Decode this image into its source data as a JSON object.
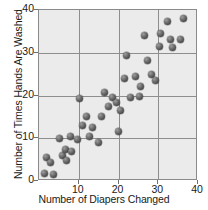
{
  "chart_data": {
    "type": "scatter",
    "title": "",
    "xlabel": "Number of Diapers Changed",
    "ylabel": "Number of Times Hands Are Washed",
    "xlim": [
      0,
      40
    ],
    "ylim": [
      0,
      40
    ],
    "xticks": [
      10,
      20,
      30,
      40
    ],
    "yticks": [
      0,
      10,
      20,
      30,
      40
    ],
    "xtick_labels": [
      "10",
      "20",
      "30",
      "40"
    ],
    "ytick_labels": [
      "0",
      "10",
      "20",
      "30",
      "40"
    ],
    "grid": true,
    "grid_color": "#8e8e8e",
    "plot_background": "#ebebeb",
    "marker_color": "#5a5a5a",
    "legend": null,
    "points": [
      [
        1.5,
        1.8
      ],
      [
        2.0,
        5.6
      ],
      [
        3.0,
        4.3
      ],
      [
        3.6,
        1.6
      ],
      [
        5.2,
        9.9
      ],
      [
        6.0,
        6.0
      ],
      [
        6.6,
        7.4
      ],
      [
        6.9,
        4.8
      ],
      [
        7.8,
        10.3
      ],
      [
        8.2,
        6.8
      ],
      [
        9.6,
        9.8
      ],
      [
        10.2,
        19.4
      ],
      [
        11.0,
        13.0
      ],
      [
        12.0,
        15.2
      ],
      [
        12.6,
        10.4
      ],
      [
        13.4,
        12.6
      ],
      [
        15.0,
        8.9
      ],
      [
        15.6,
        15.1
      ],
      [
        16.4,
        20.7
      ],
      [
        17.6,
        17.4
      ],
      [
        18.4,
        19.5
      ],
      [
        19.4,
        18.3
      ],
      [
        20.0,
        11.6
      ],
      [
        20.4,
        16.5
      ],
      [
        21.4,
        23.9
      ],
      [
        22.0,
        29.3
      ],
      [
        23.0,
        19.6
      ],
      [
        24.4,
        24.4
      ],
      [
        25.2,
        19.7
      ],
      [
        25.6,
        22.1
      ],
      [
        26.6,
        34.0
      ],
      [
        27.4,
        28.3
      ],
      [
        28.2,
        24.9
      ],
      [
        29.4,
        23.4
      ],
      [
        30.2,
        31.5
      ],
      [
        30.6,
        34.5
      ],
      [
        32.4,
        37.2
      ],
      [
        33.2,
        33.2
      ],
      [
        33.6,
        31.2
      ],
      [
        35.6,
        33.0
      ],
      [
        36.4,
        38.0
      ]
    ]
  }
}
